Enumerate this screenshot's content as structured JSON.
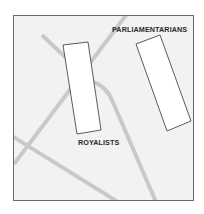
{
  "map": {
    "background": "#f2f2f2",
    "border_color": "#6a6a6a",
    "road_color": "#c8c8c8",
    "unit_outline_color": "#333333",
    "unit_fill": "#ffffff"
  },
  "labels": {
    "parliamentarians": "PARLIAMENTARIANS",
    "royalists": "ROYALISTS"
  },
  "units": [
    {
      "name": "royalists",
      "label": "ROYALISTS"
    },
    {
      "name": "parliamentarians",
      "label": "PARLIAMENTARIANS"
    }
  ]
}
